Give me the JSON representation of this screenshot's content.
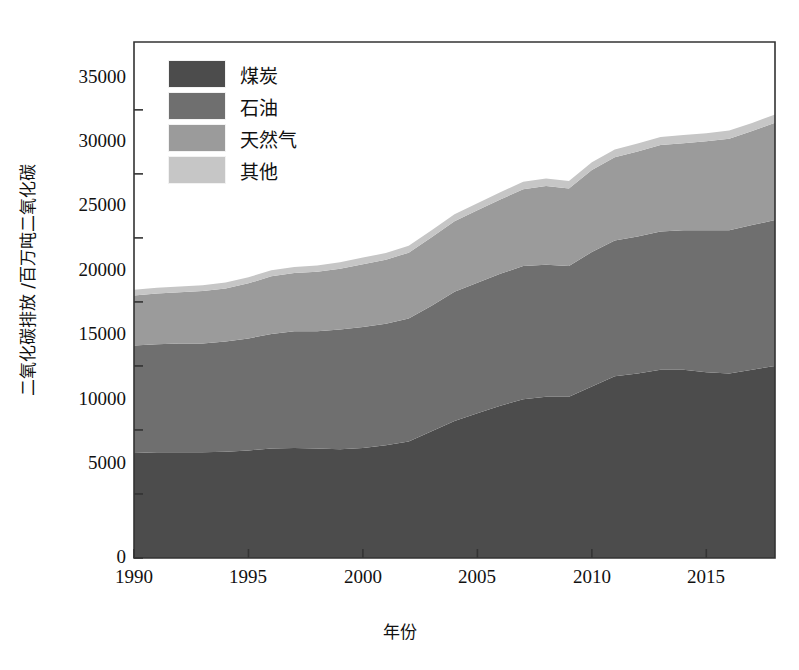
{
  "chart_data": {
    "type": "area",
    "stacked": true,
    "title": "",
    "xlabel": "年份",
    "ylabel": "二氧化碳排放 /百万吨二氧化碳",
    "xlim": [
      1990,
      2018
    ],
    "ylim": [
      0,
      40300
    ],
    "grid": false,
    "legend_position": "upper-left",
    "xticks": [
      1990,
      1995,
      2000,
      2005,
      2010,
      2015
    ],
    "yticks": [
      0,
      5000,
      10000,
      15000,
      20000,
      25000,
      30000,
      35000
    ],
    "x": [
      1990,
      1991,
      1992,
      1993,
      1994,
      1995,
      1996,
      1997,
      1998,
      1999,
      2000,
      2001,
      2002,
      2003,
      2004,
      2005,
      2006,
      2007,
      2008,
      2009,
      2010,
      2011,
      2012,
      2013,
      2014,
      2015,
      2016,
      2017,
      2018
    ],
    "series": [
      {
        "name": "煤炭",
        "color": "#4c4c4c",
        "values": [
          8200,
          8250,
          8250,
          8250,
          8300,
          8400,
          8550,
          8600,
          8550,
          8500,
          8600,
          8800,
          9100,
          9900,
          10700,
          11300,
          11900,
          12400,
          12600,
          12600,
          13400,
          14200,
          14400,
          14700,
          14700,
          14500,
          14400,
          14700,
          15000
        ]
      },
      {
        "name": "石油",
        "color": "#6f6f6f",
        "values": [
          8400,
          8450,
          8500,
          8500,
          8600,
          8750,
          8950,
          9100,
          9150,
          9350,
          9450,
          9500,
          9600,
          9800,
          10100,
          10200,
          10300,
          10400,
          10300,
          10200,
          10500,
          10600,
          10700,
          10800,
          10900,
          11100,
          11200,
          11300,
          11400
        ]
      },
      {
        "name": "天然气",
        "color": "#9b9b9b",
        "values": [
          3900,
          3950,
          4000,
          4100,
          4150,
          4300,
          4500,
          4550,
          4650,
          4750,
          4900,
          5000,
          5150,
          5350,
          5500,
          5650,
          5800,
          6000,
          6150,
          6050,
          6400,
          6500,
          6650,
          6750,
          6800,
          6950,
          7150,
          7350,
          7600
        ]
      },
      {
        "name": "其他",
        "color": "#c6c6c6",
        "values": [
          450,
          450,
          450,
          450,
          460,
          470,
          480,
          480,
          490,
          500,
          510,
          520,
          530,
          540,
          550,
          560,
          570,
          580,
          590,
          590,
          600,
          610,
          620,
          630,
          630,
          630,
          630,
          630,
          630
        ]
      }
    ],
    "totals_note": "",
    "plot_frame": {
      "left": 134,
      "right": 775,
      "top": 42,
      "bottom": 558
    }
  },
  "legend": {
    "items": [
      {
        "label": "煤炭",
        "color": "#4c4c4c"
      },
      {
        "label": "石油",
        "color": "#6f6f6f"
      },
      {
        "label": "天然气",
        "color": "#9b9b9b"
      },
      {
        "label": "其他",
        "color": "#c6c6c6"
      }
    ]
  },
  "axes": {
    "y_title": "二氧化碳排放 /百万吨二氧化碳",
    "x_title": "年份",
    "y_tick_labels": [
      "35000",
      "30000",
      "25000",
      "20000",
      "15000",
      "10000",
      "5000",
      "0"
    ],
    "x_tick_labels": [
      "1990",
      "1995",
      "2000",
      "2005",
      "2010",
      "2015"
    ]
  }
}
